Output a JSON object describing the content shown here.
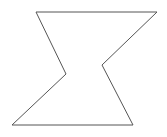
{
  "diagram": {
    "shape": "hexagon-polygon",
    "stroke_color": "#555555",
    "fill_color": "#ffffff",
    "stroke_width": 1,
    "points": [
      [
        36,
        12
      ],
      [
        157,
        12
      ],
      [
        102,
        65
      ],
      [
        133,
        125
      ],
      [
        12,
        125
      ],
      [
        66,
        74
      ]
    ]
  }
}
